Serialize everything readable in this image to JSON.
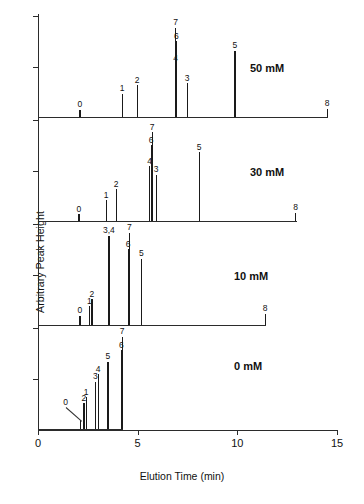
{
  "axes": {
    "ylabel": "Arbitrary Peak Height",
    "xlabel": "Elution Time (min)",
    "xticks": [
      "0",
      "5",
      "10",
      "15"
    ]
  },
  "chart_data": {
    "type": "line",
    "title": "",
    "xlabel": "Elution Time (min)",
    "ylabel": "Arbitrary Peak Height",
    "xlim": [
      0,
      15
    ],
    "ylim": [
      0,
      1
    ],
    "grid": false,
    "legend": "none",
    "note": "Four stacked chromatograms (stick/impulse traces) at increasing additive concentration. x = elution time (min), y = arbitrary peak height (normalized 0-1 per panel). Peak ids 0-8 annotated above each stick.",
    "panels": [
      {
        "label": "50 mM",
        "peaks": [
          {
            "id": "0",
            "x": 2.1,
            "y": 0.075
          },
          {
            "id": "1",
            "x": 4.22,
            "y": 0.24
          },
          {
            "id": "2",
            "x": 4.97,
            "y": 0.33
          },
          {
            "id": "4",
            "x": 6.9,
            "y": 0.56
          },
          {
            "id": "6",
            "x": 6.94,
            "y": 0.79
          },
          {
            "id": "7",
            "x": 6.9,
            "y": 0.93
          },
          {
            "id": "3",
            "x": 7.48,
            "y": 0.35
          },
          {
            "id": "5",
            "x": 9.88,
            "y": 0.69
          },
          {
            "id": "8",
            "x": 14.5,
            "y": 0.085
          }
        ]
      },
      {
        "label": "30 mM",
        "peaks": [
          {
            "id": "0",
            "x": 2.05,
            "y": 0.07
          },
          {
            "id": "1",
            "x": 3.42,
            "y": 0.215
          },
          {
            "id": "2",
            "x": 3.92,
            "y": 0.33
          },
          {
            "id": "4",
            "x": 5.6,
            "y": 0.57
          },
          {
            "id": "6",
            "x": 5.68,
            "y": 0.79
          },
          {
            "id": "7",
            "x": 5.73,
            "y": 0.925
          },
          {
            "id": "3",
            "x": 5.92,
            "y": 0.48
          },
          {
            "id": "5",
            "x": 8.08,
            "y": 0.715
          },
          {
            "id": "8",
            "x": 12.92,
            "y": 0.085
          }
        ]
      },
      {
        "label": "10 mM",
        "peaks": [
          {
            "id": "0",
            "x": 2.1,
            "y": 0.095
          },
          {
            "id": "1",
            "x": 2.58,
            "y": 0.195
          },
          {
            "id": "2",
            "x": 2.7,
            "y": 0.27
          },
          {
            "id": "3,4",
            "x": 3.56,
            "y": 0.93
          },
          {
            "id": "6",
            "x": 4.52,
            "y": 0.79
          },
          {
            "id": "7",
            "x": 4.58,
            "y": 0.96
          },
          {
            "id": "5",
            "x": 5.18,
            "y": 0.69
          },
          {
            "id": "8",
            "x": 11.4,
            "y": 0.115
          }
        ]
      },
      {
        "label": "0 mM",
        "peaks": [
          {
            "id": "0",
            "x": 2.14,
            "y": 0.095
          },
          {
            "id": "2",
            "x": 2.3,
            "y": 0.27
          },
          {
            "id": "1",
            "x": 2.42,
            "y": 0.33
          },
          {
            "id": "3",
            "x": 2.88,
            "y": 0.49
          },
          {
            "id": "4",
            "x": 3.02,
            "y": 0.57
          },
          {
            "id": "5",
            "x": 3.5,
            "y": 0.7
          },
          {
            "id": "6",
            "x": 4.18,
            "y": 0.82
          },
          {
            "id": "7",
            "x": 4.22,
            "y": 0.96
          }
        ]
      }
    ]
  }
}
